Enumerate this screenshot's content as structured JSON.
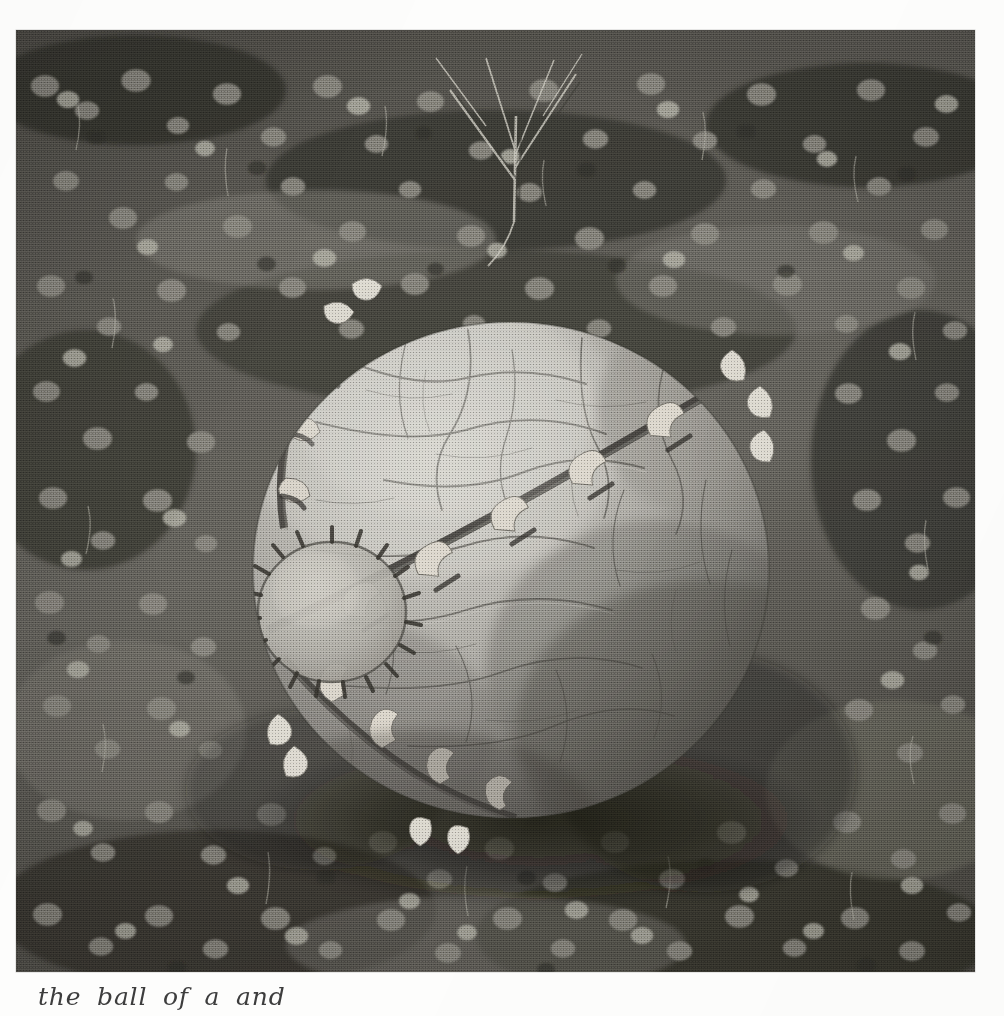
{
  "page": {
    "kind": "scanned-book-page",
    "background_color": "#fdfdfc",
    "ink_color": "#2d2d2d"
  },
  "photo": {
    "alt_title": "Large stitched leather ball resting on clover ground",
    "medium": "halftone black-and-white photograph",
    "frame": {
      "x": 16,
      "y": 30,
      "width": 959,
      "height": 942
    },
    "palette": {
      "ball_highlight": "#cfcdc8",
      "ball_midtone": "#a9a7a1",
      "ball_shadow": "#6f6d68",
      "ball_deep_shadow": "#4a4844",
      "seam_dark": "#35332f",
      "staple_light": "#e4e1d8",
      "ground_light": "#9a9890",
      "ground_mid": "#6b6963",
      "ground_dark": "#3b3935",
      "ground_deep": "#24231f"
    },
    "subject": {
      "name": "stitched sphere",
      "surface": "wrinkled cracked leather / hide",
      "features": [
        "circular stitched patch on lower-left face",
        "diagonal seam running upper-left to lower-right",
        "curved seam arcing across the upper-left shoulder",
        "rows of pale curved staples along the seams",
        "fine crack network over the whole surface"
      ],
      "center": {
        "x": 495,
        "y": 540
      },
      "radius_x": 258,
      "radius_y": 248
    },
    "setting": {
      "ground_cover": "dense round-leaved clover and low weeds",
      "extras": [
        "thin bare sprig with branching stems at top centre",
        "cast shadow pooling beneath and to the right of the ball"
      ]
    }
  },
  "caption": {
    "text": "the ball of a and",
    "visible": "top edges of letters only — line is cropped by the page bottom",
    "style": "handwritten italic"
  }
}
